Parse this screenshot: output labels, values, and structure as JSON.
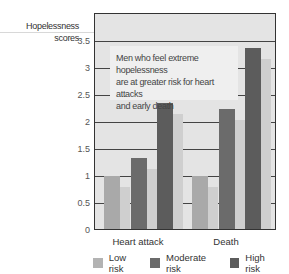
{
  "chart_data": {
    "type": "bar",
    "title": "",
    "annotation": "Men who feel extreme hopelessness are at greater risk for heart attacks and early death",
    "xlabel": "",
    "ylabel": "Hopelessness scores",
    "ylim": [
      0,
      3.5
    ],
    "yticks": [
      "0",
      "0.5",
      "1",
      "1.5",
      "2",
      "2.5",
      "3",
      "3.5"
    ],
    "categories": [
      "Heart attack",
      "Death"
    ],
    "series": [
      {
        "name": "Low risk",
        "values": [
          1.0,
          1.0
        ],
        "color": "#a9a9a9"
      },
      {
        "name": "Moderate risk",
        "values": [
          1.33,
          2.24
        ],
        "color": "#6b6b6b"
      },
      {
        "name": "High risk",
        "values": [
          2.35,
          3.37
        ],
        "color": "#5c5c5c"
      }
    ],
    "grid": true,
    "legend_position": "bottom"
  },
  "labels": {
    "ylabel_line1": "Hopelessness",
    "ylabel_line2": "scores",
    "note_line1": "Men who feel extreme hopelessness",
    "note_line2": "are at greater risk for heart attacks",
    "note_line3": "and early death",
    "cat0": "Heart attack",
    "cat1": "Death",
    "legend0": "Low risk",
    "legend1": "Moderate risk",
    "legend2": "High risk"
  }
}
